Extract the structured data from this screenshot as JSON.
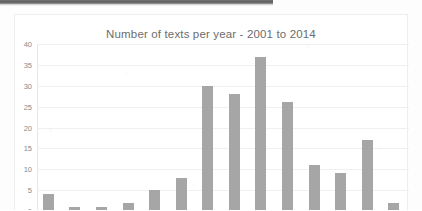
{
  "chart_data": {
    "type": "bar",
    "title": "Number of texts per year - 2001 to 2014",
    "xlabel": "",
    "ylabel": "",
    "categories": [
      "2001",
      "2002",
      "2003",
      "2004",
      "2005",
      "2006",
      "2007",
      "2008",
      "2009",
      "2010",
      "2011",
      "2012",
      "2013",
      "2014"
    ],
    "values": [
      4,
      1,
      1,
      2,
      5,
      8,
      30,
      28,
      37,
      26,
      11,
      9,
      17,
      2
    ],
    "series": [
      {
        "name": "Number of texts",
        "values": [
          4,
          1,
          1,
          2,
          5,
          8,
          30,
          28,
          37,
          26,
          11,
          9,
          17,
          2
        ]
      }
    ],
    "ylim": [
      0,
      40
    ],
    "ytick_labels": [
      "40",
      "35",
      "30",
      "25",
      "20",
      "15",
      "10",
      "5",
      "0"
    ],
    "ytick_values": [
      40,
      35,
      30,
      25,
      20,
      15,
      10,
      5,
      0
    ],
    "grid": true,
    "legend": false,
    "x_tick_labels_visible": false,
    "bar_color": "#9a9a9a",
    "gridline_color": "#f0f0f0",
    "title_color": "#6d6d6d",
    "tick_label_color": "#8a8a8a"
  }
}
